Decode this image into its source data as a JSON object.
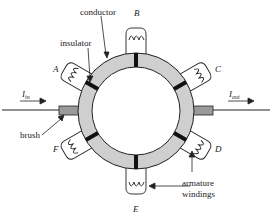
{
  "diagram": {
    "labels": {
      "conductor": "conductor",
      "insulator": "insulator",
      "brush": "brush",
      "armature_line1": "armature",
      "armature_line2": "windings",
      "current_in_main": "I",
      "current_in_sub": "in",
      "current_out_main": "I",
      "current_out_sub": "out"
    },
    "windings": [
      "A",
      "B",
      "C",
      "D",
      "E",
      "F"
    ],
    "colors": {
      "ring": "#cfcfcf",
      "brush": "#9a9a9a",
      "insulator": "#111111",
      "line": "#222222"
    }
  }
}
